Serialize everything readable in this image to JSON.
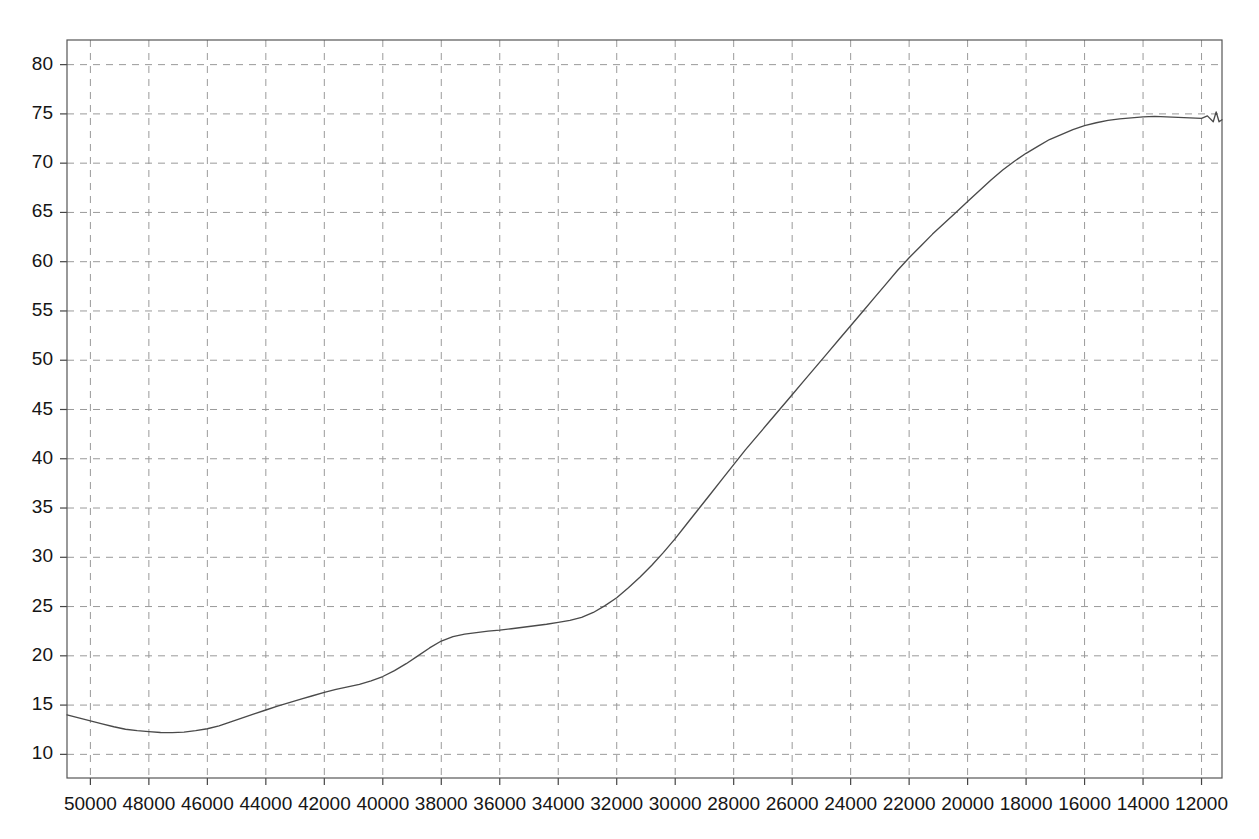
{
  "chart_data": {
    "type": "line",
    "title": "",
    "subtitle": "",
    "xlabel": "",
    "ylabel": "",
    "xlim": [
      50800,
      11300
    ],
    "ylim": [
      7.6,
      82.5
    ],
    "x_reversed": true,
    "grid": true,
    "legend": "none",
    "xticks": [
      50000,
      48000,
      46000,
      44000,
      42000,
      40000,
      38000,
      36000,
      34000,
      32000,
      30000,
      28000,
      26000,
      24000,
      22000,
      20000,
      18000,
      16000,
      14000,
      12000
    ],
    "xticklabels": [
      "50000",
      "48000",
      "46000",
      "44000",
      "42000",
      "40000",
      "38000",
      "36000",
      "34000",
      "32000",
      "30000",
      "28000",
      "26000",
      "24000",
      "22000",
      "20000",
      "18000",
      "16000",
      "14000",
      "12000"
    ],
    "yticks": [
      10,
      15,
      20,
      25,
      30,
      35,
      40,
      45,
      50,
      55,
      60,
      65,
      70,
      75,
      80
    ],
    "yticklabels": [
      "10",
      "15",
      "20",
      "25",
      "30",
      "35",
      "40",
      "45",
      "50",
      "55",
      "60",
      "65",
      "70",
      "75",
      "80"
    ],
    "line_color": "#4a4a4a",
    "grid_color": "#9a9a9a",
    "frame_color": "#555555",
    "series": [
      {
        "name": "transmittance",
        "x": [
          50800,
          50400,
          50000,
          49600,
          49200,
          48800,
          48400,
          48000,
          47600,
          47200,
          46800,
          46400,
          46000,
          45600,
          45200,
          44800,
          44400,
          44000,
          43600,
          43200,
          42800,
          42400,
          42000,
          41600,
          41200,
          40800,
          40400,
          40000,
          39600,
          39200,
          38800,
          38400,
          38000,
          37600,
          37200,
          36800,
          36400,
          36000,
          35600,
          35200,
          34800,
          34400,
          34000,
          33600,
          33200,
          32800,
          32400,
          32000,
          31600,
          31200,
          30800,
          30400,
          30000,
          29600,
          29200,
          28800,
          28400,
          28000,
          27600,
          27200,
          26800,
          26400,
          26000,
          25600,
          25200,
          24800,
          24400,
          24000,
          23600,
          23200,
          22800,
          22400,
          22000,
          21600,
          21200,
          20800,
          20400,
          20000,
          19600,
          19200,
          18800,
          18400,
          18000,
          17600,
          17200,
          16800,
          16400,
          16000,
          15600,
          15200,
          14800,
          14400,
          14000,
          13600,
          13200,
          12800,
          12400,
          12000,
          11800,
          11600,
          11500,
          11400,
          11300
        ],
        "y": [
          14.0,
          13.7,
          13.4,
          13.1,
          12.8,
          12.55,
          12.4,
          12.3,
          12.22,
          12.2,
          12.25,
          12.4,
          12.6,
          12.9,
          13.3,
          13.7,
          14.1,
          14.5,
          14.9,
          15.25,
          15.6,
          15.95,
          16.3,
          16.6,
          16.85,
          17.1,
          17.45,
          17.9,
          18.5,
          19.2,
          20.0,
          20.8,
          21.5,
          21.95,
          22.2,
          22.35,
          22.5,
          22.6,
          22.75,
          22.9,
          23.05,
          23.2,
          23.4,
          23.6,
          23.9,
          24.4,
          25.1,
          25.9,
          26.9,
          28.0,
          29.2,
          30.5,
          31.9,
          33.4,
          34.9,
          36.4,
          37.9,
          39.4,
          40.9,
          42.3,
          43.7,
          45.1,
          46.5,
          47.9,
          49.3,
          50.7,
          52.1,
          53.5,
          54.9,
          56.3,
          57.7,
          59.1,
          60.4,
          61.6,
          62.8,
          63.9,
          65.0,
          66.1,
          67.2,
          68.3,
          69.3,
          70.2,
          71.0,
          71.7,
          72.4,
          72.9,
          73.4,
          73.8,
          74.1,
          74.35,
          74.5,
          74.6,
          74.7,
          74.75,
          74.7,
          74.65,
          74.6,
          74.55,
          74.8,
          74.2,
          75.2,
          74.2,
          74.4
        ]
      }
    ],
    "annotations": []
  },
  "plot_geometry": {
    "left": 67,
    "right": 1222,
    "top": 40,
    "bottom": 778
  }
}
